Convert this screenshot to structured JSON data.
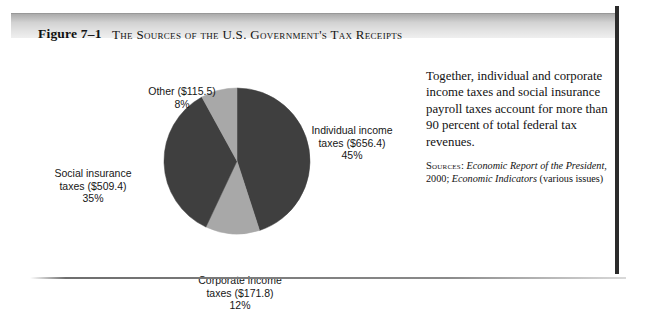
{
  "figure": {
    "number": "Figure 7–1",
    "title": "The Sources of the U.S. Government's Tax Receipts"
  },
  "labels": {
    "other": "Other ($115.5)\n8%",
    "individual": "Individual income\ntaxes ($656.4)\n45%",
    "social": "Social insurance\ntaxes ($509.4)\n35%",
    "corporate": "Corporate income\ntaxes ($171.8)\n12%"
  },
  "caption": {
    "body": "Together, individual and corporate income taxes and social insurance payroll taxes account for more than 90 percent of total federal tax revenues.",
    "sources_label": "Sources:",
    "sources_italic_1": "Economic Report of the President",
    "sources_mid": ", 2000; ",
    "sources_italic_2": "Economic Indicators",
    "sources_tail": " (various issues)"
  },
  "colors": {
    "dark_slice": "#3f3f3f",
    "light_slice": "#a8a8a8",
    "frame_border": "#2b2b2b",
    "header_band": "#d2d2d2"
  },
  "chart_data": {
    "type": "pie",
    "title": "The Sources of the U.S. Government's Tax Receipts",
    "unit": "billions of dollars",
    "start_angle_deg": 0,
    "direction": "clockwise",
    "legend": "none",
    "categories": [
      "Individual income taxes",
      "Corporate income taxes",
      "Social insurance taxes",
      "Other"
    ],
    "values": [
      656.4,
      171.8,
      509.4,
      115.5
    ],
    "percents": [
      45,
      12,
      35,
      8
    ],
    "slice_colors": [
      "#3f3f3f",
      "#a8a8a8",
      "#3f3f3f",
      "#a8a8a8"
    ],
    "slices": [
      {
        "name": "Individual income taxes",
        "value": 656.4,
        "percent": 45,
        "label": "Individual income taxes ($656.4) 45%",
        "color": "#3f3f3f"
      },
      {
        "name": "Corporate income taxes",
        "value": 171.8,
        "percent": 12,
        "label": "Corporate income taxes ($171.8) 12%",
        "color": "#a8a8a8"
      },
      {
        "name": "Social insurance taxes",
        "value": 509.4,
        "percent": 35,
        "label": "Social insurance taxes ($509.4) 35%",
        "color": "#3f3f3f"
      },
      {
        "name": "Other",
        "value": 115.5,
        "percent": 8,
        "label": "Other ($115.5) 8%",
        "color": "#a8a8a8"
      }
    ]
  }
}
